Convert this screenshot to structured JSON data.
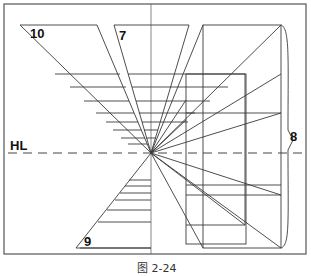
{
  "figure": {
    "caption": "图 2-24",
    "labels": {
      "horizon": "HL",
      "triangle_top_left": "10",
      "triangle_top_mid": "7",
      "triangle_bottom": "9",
      "box_right": "8"
    },
    "vanishing_point": [
      151,
      153
    ],
    "colors": {
      "line": "#3a3a3a",
      "frame": "#555555",
      "background": "#ffffff"
    }
  }
}
